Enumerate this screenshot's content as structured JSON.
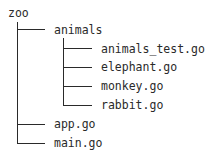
{
  "tree": {
    "root": "zoo",
    "nodes": [
      {
        "name": "animals",
        "type": "directory",
        "children": [
          {
            "name": "animals_test.go",
            "type": "file"
          },
          {
            "name": "elephant.go",
            "type": "file"
          },
          {
            "name": "monkey.go",
            "type": "file"
          },
          {
            "name": "rabbit.go",
            "type": "file"
          }
        ]
      },
      {
        "name": "app.go",
        "type": "file"
      },
      {
        "name": "main.go",
        "type": "file"
      }
    ]
  }
}
